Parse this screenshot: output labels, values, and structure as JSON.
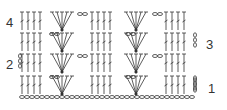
{
  "diagram": {
    "type": "crochet-stitch-chart",
    "row_labels": [
      {
        "row": "1",
        "side": "right"
      },
      {
        "row": "2",
        "side": "left"
      },
      {
        "row": "3",
        "side": "right"
      },
      {
        "row": "4",
        "side": "left"
      }
    ],
    "foundation": "chain",
    "repeat_units_per_row": 2,
    "stitch_color": "#333333"
  }
}
